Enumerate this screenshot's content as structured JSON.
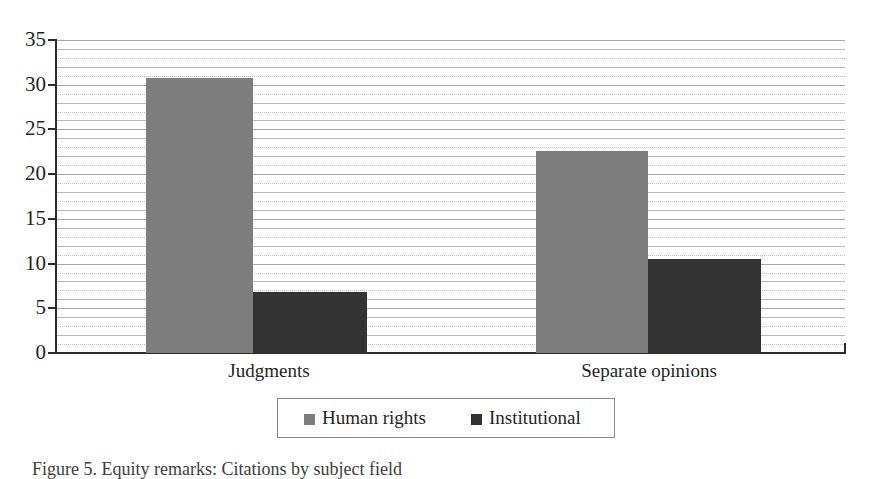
{
  "chart_data": {
    "type": "bar",
    "title": "",
    "subtitle": "",
    "xlabel": "",
    "ylabel": "",
    "categories": [
      "Judgments",
      "Separate opinions"
    ],
    "series": [
      {
        "name": "Human rights",
        "color": "#7d7d7d",
        "values": [
          30.8,
          22.6
        ]
      },
      {
        "name": "Institutional",
        "color": "#333333",
        "values": [
          6.8,
          10.5
        ]
      }
    ],
    "ylim": [
      0,
      35
    ],
    "y_major_ticks": [
      0,
      5,
      10,
      15,
      20,
      25,
      30,
      35
    ],
    "y_tick_labels": [
      "0",
      "5",
      "10",
      "15",
      "20",
      "25",
      "30",
      "35"
    ],
    "y_minor_step": 1,
    "grid": true,
    "grid_style": "alternating solid and dotted horizontal lines",
    "legend_position": "bottom-center",
    "legend_border": true
  },
  "axis": {
    "y_labels": [
      "35",
      "30",
      "25",
      "20",
      "15",
      "10",
      "5",
      "0"
    ],
    "category_labels": [
      "Judgments",
      "Separate opinions"
    ]
  },
  "legend": {
    "entries": [
      {
        "label": "Human rights",
        "swatch_color": "#7d7d7d"
      },
      {
        "label": "Institutional",
        "swatch_color": "#333333"
      }
    ]
  },
  "caption": {
    "text": "Figure 5. Equity remarks: Citations by subject field"
  },
  "colors": {
    "human_rights": "#7d7d7d",
    "institutional": "#333333",
    "axis": "#2b2b2b",
    "gridline": "#b9b9b9",
    "background": "#ffffff"
  }
}
